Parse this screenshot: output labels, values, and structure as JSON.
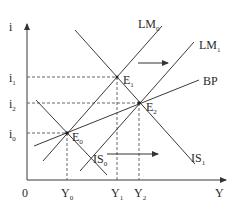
{
  "diagram": {
    "type": "IS-LM-BP economics diagram",
    "axes": {
      "y_label": "i",
      "x_label": "Y",
      "origin_label": "0"
    },
    "y_ticks": [
      "i1",
      "i2",
      "i0"
    ],
    "y_tick_labels": [
      {
        "main": "i",
        "sub": "1"
      },
      {
        "main": "i",
        "sub": "2"
      },
      {
        "main": "i",
        "sub": "0"
      }
    ],
    "x_tick_labels": [
      {
        "main": "Y",
        "sub": "0"
      },
      {
        "main": "Y",
        "sub": "1"
      },
      {
        "main": "Y",
        "sub": "2"
      }
    ],
    "curves": [
      {
        "id": "LM0",
        "main": "LM",
        "sub": "0"
      },
      {
        "id": "LM1",
        "main": "LM",
        "sub": "1"
      },
      {
        "id": "BP",
        "main": "BP",
        "sub": ""
      },
      {
        "id": "IS0",
        "main": "IS",
        "sub": "0"
      },
      {
        "id": "IS1",
        "main": "IS",
        "sub": "1"
      }
    ],
    "equilibria": [
      {
        "id": "E0",
        "main": "E",
        "sub": "0"
      },
      {
        "id": "E1",
        "main": "E",
        "sub": "1"
      },
      {
        "id": "E2",
        "main": "E",
        "sub": "2"
      }
    ],
    "shift_arrows": [
      {
        "id": "lm-shift",
        "direction": "right",
        "meaning": "LM0 to LM1"
      },
      {
        "id": "is-shift",
        "direction": "right",
        "meaning": "IS0 to IS1"
      }
    ]
  }
}
